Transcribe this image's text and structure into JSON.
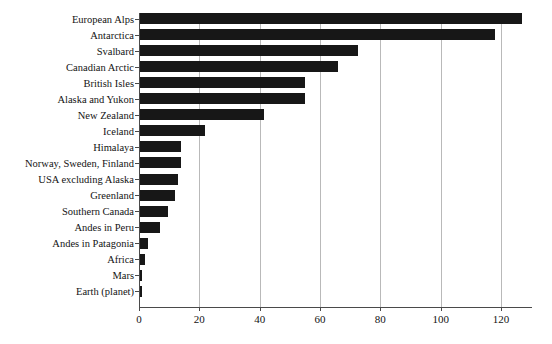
{
  "chart_data": {
    "type": "bar",
    "orientation": "horizontal",
    "title": "",
    "subtitle": "",
    "xlabel": "",
    "ylabel": "",
    "xlim": [
      0,
      131
    ],
    "xticks": [
      0,
      20,
      40,
      60,
      80,
      100,
      120
    ],
    "xtick_labels": [
      "0",
      "20",
      "40",
      "60",
      "80",
      "100",
      "120"
    ],
    "grid": "vertical",
    "legend": "none",
    "bar_color": "#171717",
    "grid_color": "#b9b9b9",
    "axis_color": "#4a4a4a",
    "background_color": "#ffffff",
    "categories": [
      "European Alps",
      "Antarctica",
      "Svalbard",
      "Canadian Arctic",
      "British Isles",
      "Alaska and Yukon",
      "New Zealand",
      "Iceland",
      "Himalaya",
      "Norway, Sweden, Finland",
      "USA excluding Alaska",
      "Greenland",
      "Southern Canada",
      "Andes in Peru",
      "Andes in Patagonia",
      "Africa",
      "Mars",
      "Earth (planet)"
    ],
    "values": [
      127,
      118,
      72.5,
      66,
      55,
      55,
      41.5,
      22,
      14,
      14,
      13,
      12,
      9.5,
      7,
      3,
      2,
      1,
      1
    ]
  }
}
